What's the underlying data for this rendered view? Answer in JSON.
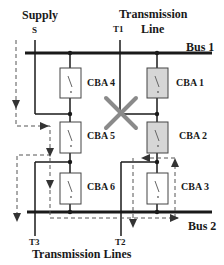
{
  "labels": {
    "supply": "Supply",
    "supply_node": "S",
    "transmission_line_1": "Transmission",
    "transmission_line_2": "Line",
    "t1": "T1",
    "bus1": "Bus 1",
    "bus2": "Bus 2",
    "t2": "T2",
    "t3": "T3",
    "transmission_lines": "Transmission Lines"
  },
  "breakers": [
    {
      "id": "cba4",
      "label": "CBA 4",
      "shaded": false
    },
    {
      "id": "cba5",
      "label": "CBA 5",
      "shaded": false
    },
    {
      "id": "cba6",
      "label": "CBA 6",
      "shaded": false
    },
    {
      "id": "cba1",
      "label": "CBA 1",
      "shaded": true
    },
    {
      "id": "cba2",
      "label": "CBA 2",
      "shaded": true
    },
    {
      "id": "cba3",
      "label": "CBA 3",
      "shaded": false
    }
  ],
  "colors": {
    "line": "#1a1a1a",
    "breaker_fill": "#ffffff",
    "breaker_shaded_fill": "#d6d6d6",
    "fault_x": "#8a8a8a",
    "flow_dashed": "#555555"
  }
}
